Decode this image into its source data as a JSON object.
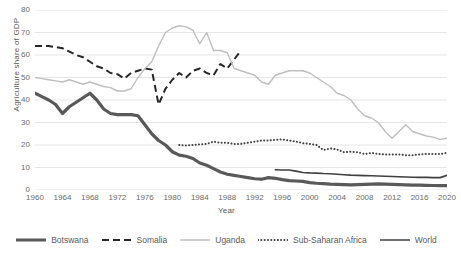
{
  "chart_data": {
    "type": "line",
    "title": "",
    "xlabel": "Year",
    "ylabel": "Agriculture share of GDP",
    "xlim": [
      1960,
      2020
    ],
    "ylim": [
      0,
      80
    ],
    "grid": true,
    "legend_position": "bottom",
    "xticks": [
      1960,
      1964,
      1968,
      1972,
      1976,
      1980,
      1984,
      1988,
      1992,
      1996,
      2000,
      2004,
      2008,
      2012,
      2016,
      2020
    ],
    "yticks": [
      0,
      10,
      20,
      30,
      40,
      50,
      60,
      70,
      80
    ],
    "colors": {
      "botswana": "#595959",
      "somalia": "#262626",
      "uganda": "#bfbfbf",
      "sub_saharan_africa": "#404040",
      "world": "#404040"
    },
    "series": [
      {
        "name": "Botswana",
        "style": "solid-thick",
        "color": "#595959",
        "x": [
          1960,
          1961,
          1962,
          1963,
          1964,
          1965,
          1966,
          1967,
          1968,
          1969,
          1970,
          1971,
          1972,
          1973,
          1974,
          1975,
          1976,
          1977,
          1978,
          1979,
          1980,
          1981,
          1982,
          1983,
          1984,
          1985,
          1986,
          1987,
          1988,
          1989,
          1990,
          1991,
          1992,
          1993,
          1994,
          1995,
          1996,
          1997,
          1998,
          1999,
          2000,
          2001,
          2002,
          2003,
          2004,
          2005,
          2006,
          2007,
          2008,
          2009,
          2010,
          2011,
          2012,
          2013,
          2014,
          2015,
          2016,
          2017,
          2018,
          2019,
          2020
        ],
        "values": [
          43,
          41.5,
          40,
          38,
          34,
          37,
          39,
          41,
          43,
          40,
          36,
          34,
          33.5,
          33.5,
          33.5,
          33,
          29,
          25,
          22,
          20,
          17,
          15.5,
          15,
          14,
          12,
          11,
          9.5,
          8,
          7,
          6.5,
          6,
          5.5,
          5,
          4.8,
          5.5,
          5.2,
          4.6,
          4.2,
          4,
          3.8,
          3.3,
          3,
          2.8,
          2.6,
          2.5,
          2.4,
          2.3,
          2.4,
          2.5,
          2.6,
          2.7,
          2.6,
          2.5,
          2.4,
          2.3,
          2.2,
          2.2,
          2.1,
          2,
          1.9,
          1.9
        ]
      },
      {
        "name": "Somalia",
        "style": "dashed",
        "color": "#262626",
        "x": [
          1960,
          1961,
          1962,
          1963,
          1964,
          1965,
          1966,
          1967,
          1968,
          1969,
          1970,
          1971,
          1972,
          1973,
          1974,
          1975,
          1976,
          1977,
          1978,
          1979,
          1980,
          1981,
          1982,
          1983,
          1984,
          1985,
          1986,
          1987,
          1988,
          1989,
          1990
        ],
        "values": [
          64,
          64,
          64,
          63.5,
          63,
          61.5,
          60,
          59,
          57,
          55,
          54,
          52,
          51.5,
          49.5,
          52,
          53,
          54,
          53.5,
          38,
          45,
          49,
          52,
          50,
          53,
          54,
          52,
          51,
          56,
          54,
          58,
          62
        ]
      },
      {
        "name": "Uganda",
        "style": "solid-light",
        "color": "#bfbfbf",
        "x": [
          1960,
          1961,
          1962,
          1963,
          1964,
          1965,
          1966,
          1967,
          1968,
          1969,
          1970,
          1971,
          1972,
          1973,
          1974,
          1975,
          1976,
          1977,
          1978,
          1979,
          1980,
          1981,
          1982,
          1983,
          1984,
          1985,
          1986,
          1987,
          1988,
          1989,
          1990,
          1991,
          1992,
          1993,
          1994,
          1995,
          1996,
          1997,
          1998,
          1999,
          2000,
          2001,
          2002,
          2003,
          2004,
          2005,
          2006,
          2007,
          2008,
          2009,
          2010,
          2011,
          2012,
          2013,
          2014,
          2015,
          2016,
          2017,
          2018,
          2019,
          2020
        ],
        "values": [
          50,
          49.5,
          49,
          48.5,
          48,
          49,
          48,
          47,
          48,
          47,
          46,
          45.5,
          44,
          44,
          45,
          50,
          54,
          57,
          64,
          70,
          72,
          73,
          72.5,
          71,
          65,
          70,
          62,
          62,
          61,
          54,
          53,
          52,
          51,
          48,
          47,
          51,
          52,
          53,
          53,
          53,
          52,
          50,
          48,
          46,
          43,
          42,
          40,
          36,
          33,
          32,
          30,
          26,
          23,
          26,
          29,
          26,
          25,
          24,
          23.5,
          22.5,
          23
        ]
      },
      {
        "name": "Sub-Saharan Africa",
        "style": "dotted",
        "color": "#404040",
        "x": [
          1981,
          1982,
          1983,
          1984,
          1985,
          1986,
          1987,
          1988,
          1989,
          1990,
          1991,
          1992,
          1993,
          1994,
          1995,
          1996,
          1997,
          1998,
          1999,
          2000,
          2001,
          2002,
          2003,
          2004,
          2005,
          2006,
          2007,
          2008,
          2009,
          2010,
          2011,
          2012,
          2013,
          2014,
          2015,
          2016,
          2017,
          2018,
          2019,
          2020
        ],
        "values": [
          20,
          19.8,
          20,
          20.3,
          20.5,
          21.5,
          21,
          21,
          20.5,
          20.5,
          21,
          21.5,
          22,
          22,
          22.3,
          22.5,
          22,
          21.5,
          20.8,
          20.5,
          20,
          17.8,
          18.5,
          18,
          16.8,
          17,
          16.8,
          16,
          16.5,
          16,
          15.8,
          15.8,
          15.8,
          15.5,
          15.5,
          15.8,
          16,
          16,
          16,
          16.5
        ]
      },
      {
        "name": "World",
        "style": "solid-thin",
        "color": "#404040",
        "x": [
          1995,
          1996,
          1997,
          1998,
          1999,
          2000,
          2001,
          2002,
          2003,
          2004,
          2005,
          2006,
          2007,
          2008,
          2009,
          2010,
          2011,
          2012,
          2013,
          2014,
          2015,
          2016,
          2017,
          2018,
          2019,
          2020
        ],
        "values": [
          9,
          8.9,
          8.9,
          8.4,
          7.8,
          7.6,
          7.5,
          7.3,
          7.2,
          7,
          6.8,
          6.6,
          6.5,
          6.4,
          6.3,
          6.2,
          6.1,
          6,
          5.9,
          5.8,
          5.7,
          5.6,
          5.6,
          5.5,
          5.5,
          6.5
        ]
      }
    ]
  },
  "legend": {
    "items": [
      {
        "label": "Botswana",
        "style": "solid-thick"
      },
      {
        "label": "Somalia",
        "style": "dashed"
      },
      {
        "label": "Uganda",
        "style": "solid-light"
      },
      {
        "label": "Sub-Saharan Africa",
        "style": "dotted"
      },
      {
        "label": "World",
        "style": "solid-thin"
      }
    ]
  }
}
